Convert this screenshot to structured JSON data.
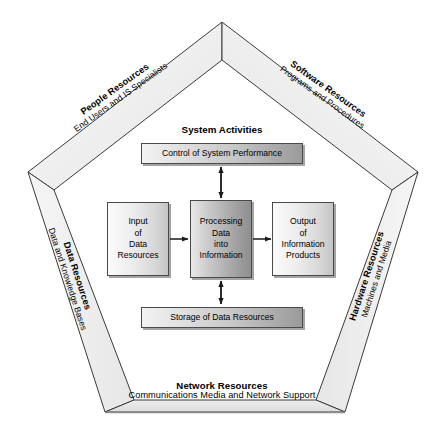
{
  "diagram": {
    "heading": "System Activities",
    "resource_bands": [
      {
        "id": "people",
        "title": "People Resources",
        "subtitle": "End Users and IS Specialists",
        "position": "upper-left"
      },
      {
        "id": "software",
        "title": "Software Resources",
        "subtitle": "Programs and Procedures",
        "position": "upper-right"
      },
      {
        "id": "data",
        "title": "Data Resources",
        "subtitle": "Data and Knowledge Bases",
        "position": "left"
      },
      {
        "id": "hardware",
        "title": "Hardware Resources",
        "subtitle": "Machines and Media",
        "position": "right"
      },
      {
        "id": "network",
        "title": "Network Resources",
        "subtitle": "Communications Media and Network Support",
        "position": "bottom"
      }
    ],
    "activity_boxes": [
      {
        "id": "control",
        "lines": [
          "Control of System Performance"
        ],
        "style": "wide-gradient"
      },
      {
        "id": "input",
        "lines": [
          "Input",
          "of",
          "Data",
          "Resources"
        ],
        "style": "light-gradient"
      },
      {
        "id": "processing",
        "lines": [
          "Processing",
          "Data",
          "into",
          "Information"
        ],
        "style": "dark-gradient"
      },
      {
        "id": "output",
        "lines": [
          "Output",
          "of",
          "Information",
          "Products"
        ],
        "style": "light-gradient"
      },
      {
        "id": "storage",
        "lines": [
          "Storage of Data Resources"
        ],
        "style": "wide-gradient"
      }
    ],
    "connectors": [
      {
        "from": "input",
        "to": "processing",
        "type": "single-arrow",
        "direction": "right"
      },
      {
        "from": "processing",
        "to": "output",
        "type": "single-arrow",
        "direction": "right"
      },
      {
        "from": "control",
        "to": "processing",
        "type": "double-arrow",
        "direction": "vertical"
      },
      {
        "from": "processing",
        "to": "storage",
        "type": "double-arrow",
        "direction": "vertical"
      }
    ],
    "colors": {
      "band_fill": "#ececec",
      "band_fill_light": "#f4f4f4",
      "outline": "#3a3a3a",
      "box_border": "#4a4a4a",
      "text": "#000000",
      "background": "#ffffff"
    }
  }
}
